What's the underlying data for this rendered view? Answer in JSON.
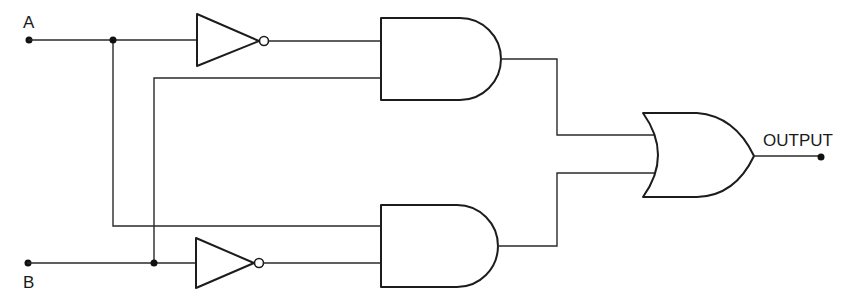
{
  "diagram": {
    "type": "logic-circuit",
    "function": "XOR (A·B' + A'·B)",
    "labels": {
      "input_a": "A",
      "input_b": "B",
      "output": "OUTPUT"
    },
    "components": [
      {
        "id": "not-a",
        "kind": "NOT",
        "input": "A"
      },
      {
        "id": "not-b",
        "kind": "NOT",
        "input": "B"
      },
      {
        "id": "and-top",
        "kind": "AND",
        "inputs": [
          "NOT A",
          "B"
        ]
      },
      {
        "id": "and-bottom",
        "kind": "AND",
        "inputs": [
          "A",
          "NOT B"
        ]
      },
      {
        "id": "or-out",
        "kind": "OR",
        "inputs": [
          "and-top",
          "and-bottom"
        ],
        "output": "OUTPUT"
      }
    ],
    "colors": {
      "stroke": "#1c1c1c",
      "background": "#ffffff"
    }
  }
}
